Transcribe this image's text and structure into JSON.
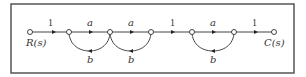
{
  "diagram": {
    "type": "signal-flow-graph",
    "frame": {
      "x": 11,
      "y": 4,
      "width": 283,
      "height": 69,
      "stroke": "#555555"
    },
    "nodes": [
      {
        "id": "R",
        "x": 30,
        "y": 32,
        "label": "R(s)"
      },
      {
        "id": "n2",
        "x": 69,
        "y": 32,
        "label": ""
      },
      {
        "id": "n3",
        "x": 110,
        "y": 32,
        "label": ""
      },
      {
        "id": "n4",
        "x": 151,
        "y": 32,
        "label": ""
      },
      {
        "id": "n5",
        "x": 192,
        "y": 32,
        "label": ""
      },
      {
        "id": "n6",
        "x": 234,
        "y": 32,
        "label": ""
      },
      {
        "id": "C",
        "x": 274,
        "y": 32,
        "label": "C(s)"
      }
    ],
    "forward_branches": [
      {
        "from": "R",
        "to": "n2",
        "gain": "1"
      },
      {
        "from": "n2",
        "to": "n3",
        "gain": "a"
      },
      {
        "from": "n3",
        "to": "n4",
        "gain": "a"
      },
      {
        "from": "n4",
        "to": "n5",
        "gain": "1"
      },
      {
        "from": "n5",
        "to": "n6",
        "gain": "a"
      },
      {
        "from": "n6",
        "to": "C",
        "gain": "1"
      }
    ],
    "feedback_branches": [
      {
        "from": "n3",
        "to": "n2",
        "gain": "b"
      },
      {
        "from": "n4",
        "to": "n3",
        "gain": "b"
      },
      {
        "from": "n6",
        "to": "n5",
        "gain": "b"
      }
    ],
    "labels": {
      "input": "R(s)",
      "output": "C(s)",
      "g1": "1",
      "g2": "a",
      "g3": "a",
      "g4": "1",
      "g5": "a",
      "g6": "1",
      "f1": "b",
      "f2": "b",
      "f3": "b"
    }
  }
}
